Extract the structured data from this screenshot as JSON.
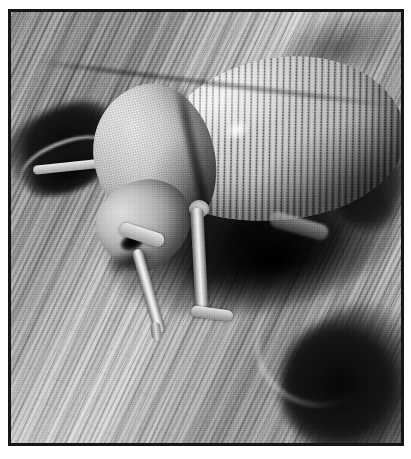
{
  "page": {
    "background_color": "#ffffff",
    "width": 411,
    "height": 459
  },
  "figure": {
    "type": "photograph",
    "medium": "black-and-white halftone print",
    "border_color": "#161616",
    "border_width_px": 3,
    "frame": {
      "left": 8,
      "top": 9,
      "width": 396,
      "height": 437
    },
    "caption": ""
  },
  "scene": {
    "subject": "beetle",
    "subject_parts": [
      {
        "name": "pronotum",
        "label": "pronotum"
      },
      {
        "name": "elytra",
        "label": "elytra"
      },
      {
        "name": "head",
        "label": "head"
      },
      {
        "name": "eye",
        "label": "eye"
      },
      {
        "name": "front-leg",
        "label": "front leg"
      },
      {
        "name": "middle-leg",
        "label": "middle leg"
      },
      {
        "name": "hind-leg",
        "label": "hind leg"
      },
      {
        "name": "antenna",
        "label": "antenna"
      }
    ],
    "background": {
      "surface": "weathered wood",
      "grain_direction_deg": 116,
      "features": [
        {
          "name": "bore-hole-left",
          "label": "dark bore hole"
        },
        {
          "name": "crack-right",
          "label": "dark crack"
        },
        {
          "name": "crevice-bottom-right",
          "label": "shadowed crevice"
        }
      ]
    },
    "palette": {
      "highlight": "#f0f0f0",
      "light_wood": "#c9c9c9",
      "mid_wood": "#a0a0a0",
      "dark_wood": "#6b6b6b",
      "shadow": "#141414",
      "black": "#0a0a0a"
    }
  }
}
